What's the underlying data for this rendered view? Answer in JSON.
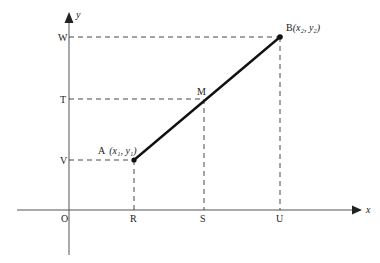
{
  "diagram": {
    "type": "coordinate-geometry-line-segment",
    "axes": {
      "x_label": "x",
      "y_label": "y",
      "origin_label": "O"
    },
    "x_ticks": [
      {
        "label": "R",
        "px": 134
      },
      {
        "label": "S",
        "px": 204
      },
      {
        "label": "U",
        "px": 280
      }
    ],
    "y_ticks": [
      {
        "label": "W",
        "py": 37
      },
      {
        "label": "T",
        "py": 99
      },
      {
        "label": "V",
        "py": 160
      }
    ],
    "points": {
      "A": {
        "name": "A",
        "coord_text": "(x₁, y₁)",
        "px": 134,
        "py": 160
      },
      "B": {
        "name": "B",
        "coord_text": "(x₂, y₂)",
        "px": 280,
        "py": 37
      },
      "M": {
        "name": "M",
        "px": 204,
        "py": 99
      }
    },
    "segment": "AB",
    "midpoint": "M"
  }
}
